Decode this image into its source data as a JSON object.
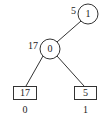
{
  "diagram": {
    "type": "tree",
    "colors": {
      "stroke": "#333333",
      "text": "#222222",
      "background": "#ffffff"
    },
    "nodes": [
      {
        "id": "root",
        "shape": "circle",
        "value": "1",
        "side_label": "5",
        "cx": 88,
        "cy": 14,
        "r": 10
      },
      {
        "id": "mid",
        "shape": "circle",
        "value": "0",
        "side_label": "17",
        "cx": 50,
        "cy": 49,
        "r": 10
      },
      {
        "id": "leaf-left",
        "shape": "box",
        "value": "17",
        "below_label": "0",
        "x": 13,
        "y": 86,
        "w": 24,
        "h": 14
      },
      {
        "id": "leaf-right",
        "shape": "box",
        "value": "5",
        "below_label": "1",
        "x": 74,
        "y": 86,
        "w": 23,
        "h": 14
      }
    ],
    "edges": [
      {
        "from": "root",
        "to": "mid"
      },
      {
        "from": "mid",
        "to": "leaf-left"
      },
      {
        "from": "mid",
        "to": "leaf-right"
      }
    ]
  }
}
